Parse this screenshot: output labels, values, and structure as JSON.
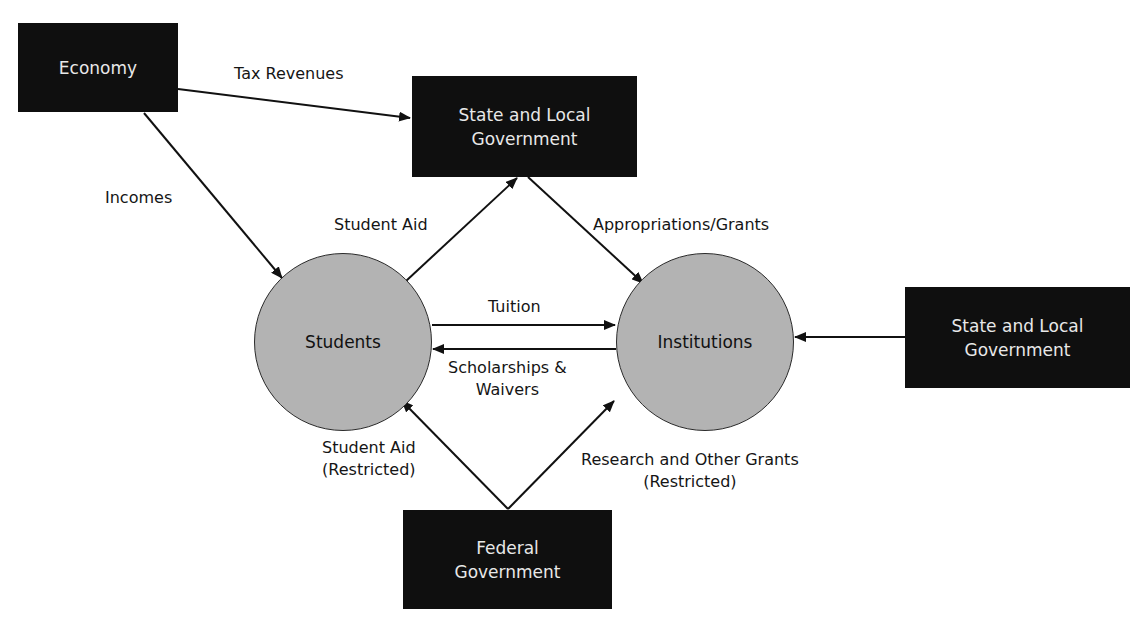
{
  "nodes": {
    "economy": {
      "label": "Economy",
      "type": "box"
    },
    "state_local_top": {
      "line1": "State and Local",
      "line2": "Government",
      "type": "box"
    },
    "students": {
      "label": "Students",
      "type": "circle"
    },
    "institutions": {
      "label": "Institutions",
      "type": "circle"
    },
    "state_local_right": {
      "line1": "State and Local",
      "line2": "Government",
      "type": "box"
    },
    "federal": {
      "line1": "Federal",
      "line2": "Government",
      "type": "box"
    }
  },
  "edges": {
    "tax_revenues": {
      "label": "Tax Revenues",
      "from": "economy",
      "to": "state_local_top"
    },
    "incomes": {
      "label": "Incomes",
      "from": "economy",
      "to": "students"
    },
    "student_aid": {
      "label": "Student Aid",
      "from": "students",
      "to": "state_local_top"
    },
    "appropriations": {
      "label": "Appropriations/Grants",
      "from": "state_local_top",
      "to": "institutions"
    },
    "tuition": {
      "label": "Tuition",
      "from": "students",
      "to": "institutions"
    },
    "scholarships": {
      "line1": "Scholarships &",
      "line2": "Waivers",
      "from": "institutions",
      "to": "students"
    },
    "state_local_right_flow": {
      "label": "",
      "from": "state_local_right",
      "to": "institutions"
    },
    "student_aid_restricted": {
      "line1": "Student Aid",
      "line2": "(Restricted)",
      "from": "federal",
      "to": "students"
    },
    "research_grants": {
      "line1": "Research and Other Grants",
      "line2": "(Restricted)",
      "from": "federal",
      "to": "institutions"
    }
  },
  "colors": {
    "box_fill": "#0f0f0f",
    "box_text": "#e8e8e8",
    "circle_fill": "#b3b3b3",
    "line": "#111111"
  }
}
